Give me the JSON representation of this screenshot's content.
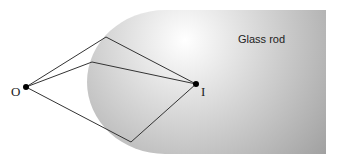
{
  "diagram": {
    "labels": {
      "object": "O",
      "image": "I",
      "medium": "Glass rod"
    },
    "points": {
      "object": [
        26,
        87
      ],
      "image": [
        196,
        84
      ]
    },
    "rays": [
      {
        "from": "O",
        "refract_at": [
          106,
          37
        ],
        "to": "I"
      },
      {
        "from": "O",
        "refract_at": [
          92,
          62
        ],
        "to": "I"
      },
      {
        "from": "O",
        "refract_at": [
          131,
          142
        ],
        "to": "I"
      }
    ],
    "colors": {
      "ray": "#333333",
      "rod_light": "#fafafa",
      "rod_dark": "#9a9a9a",
      "point": "#000000"
    }
  }
}
